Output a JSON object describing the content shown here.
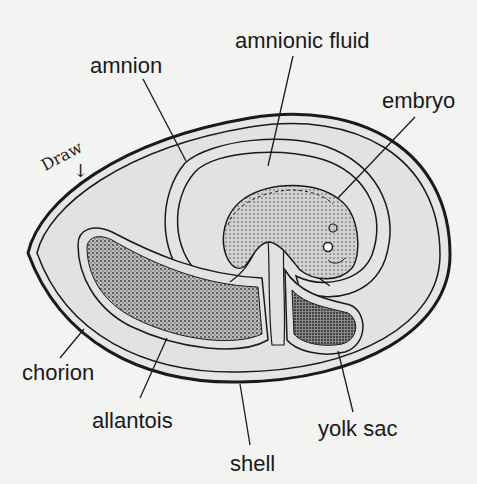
{
  "diagram": {
    "handwritten_note": "Draw",
    "handwritten_arrow": "↓",
    "labels": {
      "amnion": "amnion",
      "amnionic_fluid": "amnionic fluid",
      "embryo": "embryo",
      "chorion": "chorion",
      "allantois": "allantois",
      "yolk_sac": "yolk sac",
      "shell": "shell"
    },
    "colors": {
      "background": "#f3f3f1",
      "egg_fill": "#e4e4e2",
      "stroke": "#1a1a1a",
      "stipple": "#555555"
    }
  }
}
